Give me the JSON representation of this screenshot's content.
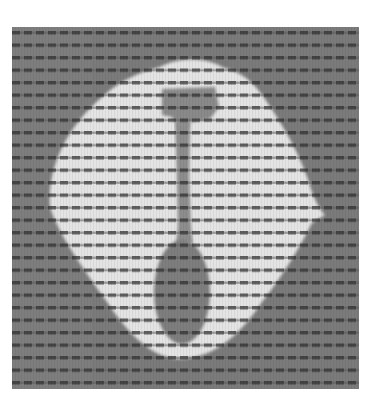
{
  "image": {
    "kind": "grayscale scan",
    "description": "Light blob on gray background with a dark T-shaped head, thin stem, and dark oval, overlaid by dark horizontal dotted stripes",
    "colors": {
      "background": "#ffffff",
      "field": "#7d7d7d",
      "blob": "#e6e6e6",
      "inner_dark": "#858585",
      "stripe": "#3a3a3a"
    },
    "stripe_spacing_px": 12.5
  }
}
